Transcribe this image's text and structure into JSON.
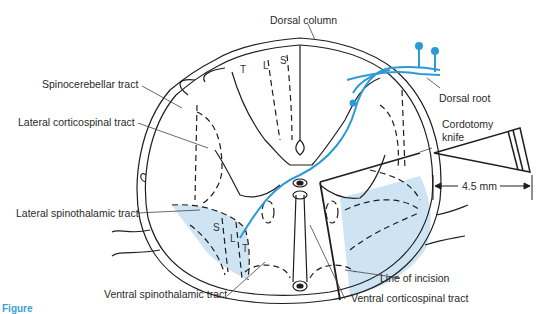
{
  "diagram": {
    "colors": {
      "line": "#1e1e1e",
      "nerve_fiber": "#2c9ad6",
      "shaded_region": "#cfe4f3",
      "caption": "#3aa0d8"
    },
    "labels": {
      "dorsal_column": "Dorsal column",
      "spinocerebellar_tract": "Spinocerebellar tract",
      "lateral_corticospinal_tract": "Lateral corticospinal tract",
      "lateral_spinothalamic_tract": "Lateral spinothalamic tract",
      "ventral_spinothalamic_tract": "Ventral spinothalamic tract",
      "ventral_corticospinal_tract": "Ventral corticospinal tract",
      "line_of_incision": "Line of incision",
      "dorsal_root": "Dorsal root",
      "cordotomy_knife_line1": "Cordotomy",
      "cordotomy_knife_line2": "knife",
      "measurement": "4.5 mm"
    },
    "tract_letters": {
      "dorsal_T": "T",
      "dorsal_L": "L",
      "dorsal_S": "S",
      "lateral_S": "S",
      "lateral_L": "L",
      "lateral_T": "T"
    },
    "caption": "Figure"
  }
}
